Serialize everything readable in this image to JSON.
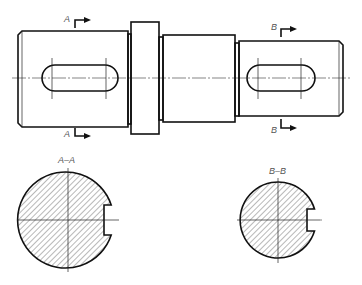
{
  "drawing": {
    "type": "shaft with keyways - removed sections",
    "cut_labels": {
      "a_top": "A",
      "a_bottom": "A",
      "b_top": "B",
      "b_bottom": "B"
    },
    "sections": [
      {
        "label": "A–A",
        "description": "section through left keyway"
      },
      {
        "label": "B–B",
        "description": "section through right keyway"
      }
    ],
    "colors": {
      "line": "#111111",
      "label": "#555555",
      "background": "#ffffff"
    }
  }
}
